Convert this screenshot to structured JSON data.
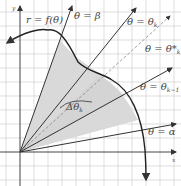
{
  "figure": {
    "curve_label": "r = f(θ)",
    "ray_labels": {
      "beta": "θ = β",
      "theta_k": "θ = θ",
      "theta_k_sub": "k",
      "theta_star": "θ = θ*",
      "theta_star_sub": "k",
      "theta_k_minus_1": "θ = θ",
      "theta_k_minus_1_sub": "k−1",
      "alpha": "θ = α"
    },
    "delta_label": "Δθ",
    "delta_sub": "k",
    "axis_x": "x",
    "axis_y": "y",
    "colors": {
      "shade": "#d9d9d9",
      "grid": "#d0d0d0",
      "line": "#333333"
    }
  }
}
